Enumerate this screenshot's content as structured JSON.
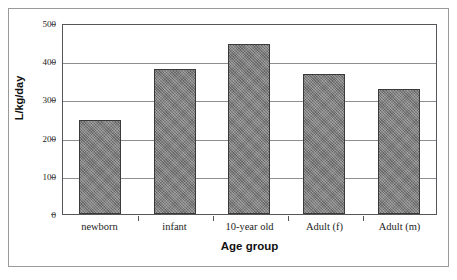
{
  "chart_data": {
    "type": "bar",
    "title": "",
    "subtitle": "",
    "categories": [
      "newborn",
      "infant",
      "10-year old",
      "Adult (f)",
      "Adult (m)"
    ],
    "values": [
      250,
      383,
      450,
      370,
      330
    ],
    "xlabel": "Age group",
    "ylabel": "L/kg/day",
    "ylim": [
      0,
      500
    ],
    "yticks": [
      0,
      100,
      200,
      300,
      400,
      500
    ],
    "ytick_labels": [
      "0",
      "100",
      "200",
      "300",
      "400",
      "500"
    ],
    "grid": "horizontal",
    "legend": "none",
    "bar_color": "#7d7d7d",
    "bar_edge_color": "#3a3a3a",
    "gridline_color": "#8d8d92",
    "axis_color": "#55555a",
    "text_color": "#1d1d1d",
    "background_color": "#ffffff",
    "annotations": []
  }
}
